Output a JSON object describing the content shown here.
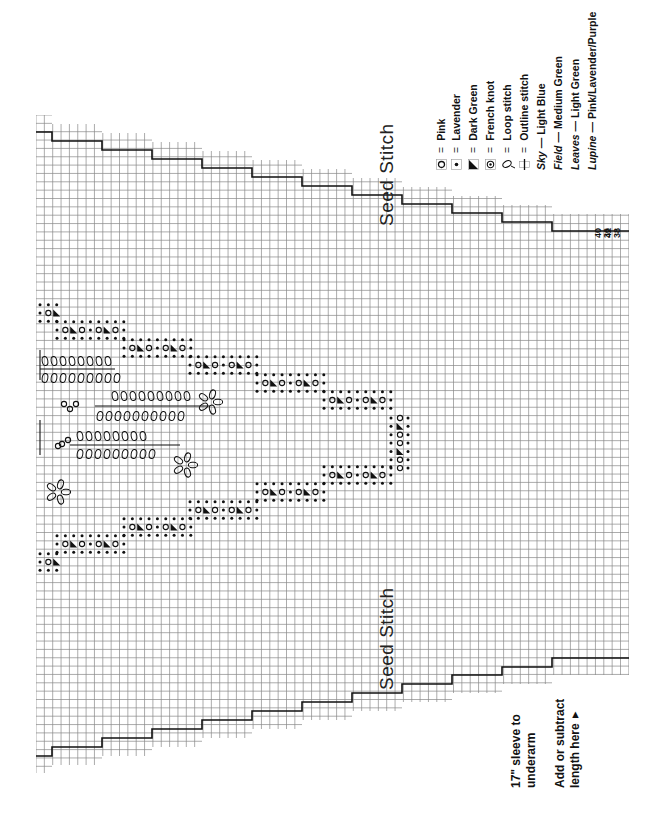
{
  "chart": {
    "type": "knitting-chart",
    "orientation": "rotated-90",
    "labels": {
      "seed_stitch_top": "Seed Stitch",
      "seed_stitch_bottom": "Seed Stitch"
    },
    "sizes": {
      "row1": "40",
      "row2": "42",
      "row3": "36",
      "row4": "38"
    },
    "notes": {
      "sleeve_line1": "17\" sleeve to",
      "sleeve_line2": "underarm",
      "adjust_line1": "Add or subtract",
      "adjust_line2": "length here",
      "adjust_arrow": "▲"
    }
  },
  "legend": {
    "items": [
      {
        "symbol": "pink-circle",
        "eq": "=",
        "label": "Pink"
      },
      {
        "symbol": "lavender-dot",
        "eq": "=",
        "label": "Lavender"
      },
      {
        "symbol": "dark-green-triangle",
        "eq": "=",
        "label": "Dark Green"
      },
      {
        "symbol": "french-knot",
        "eq": "=",
        "label": "French knot"
      },
      {
        "symbol": "loop-stitch",
        "eq": "=",
        "label": "Loop stitch"
      },
      {
        "symbol": "outline-stitch",
        "eq": "=",
        "label": "Outline stitch"
      }
    ],
    "colors": [
      {
        "name": "Sky",
        "sep": "—",
        "value": "Light Blue"
      },
      {
        "name": "Field",
        "sep": "—",
        "value": "Medium Green"
      },
      {
        "name": "Leaves",
        "sep": "—",
        "value": "Light Green"
      },
      {
        "name": "Lupine",
        "sep": "—",
        "value": "Pink/Lavender/Purple"
      }
    ]
  }
}
